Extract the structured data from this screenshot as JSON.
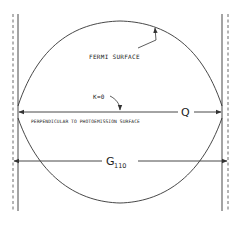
{
  "diagram": {
    "labels": {
      "fermi_surface": "FERMI SURFACE",
      "k_zero": "K=0",
      "perpendicular": "PERPENDICULAR TO PHOTOEMISSION SURFACE",
      "q": "Q",
      "g_main": "G",
      "g_sub": "110"
    },
    "colors": {
      "line": "#333333",
      "background": "#ffffff"
    }
  }
}
